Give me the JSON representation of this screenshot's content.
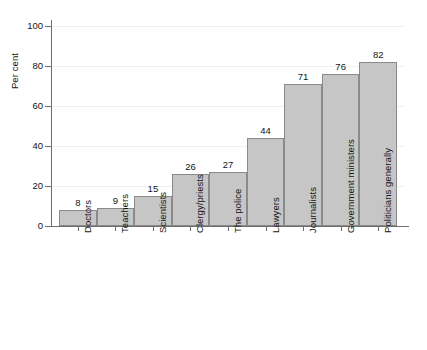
{
  "chart_data": {
    "type": "bar",
    "title": "",
    "subtitle": "",
    "xlabel": "",
    "ylabel": "Per cent",
    "ylim": [
      0,
      100
    ],
    "yticks": [
      0,
      20,
      40,
      60,
      80,
      100
    ],
    "grid": true,
    "legend": false,
    "orientation": "vertical",
    "bar_color": "#c6c6c6",
    "bar_border_color": "#8a8a8a",
    "axis_color": "#6e6e6e",
    "gridline_color": "#f0f0f0",
    "text_color": "#141414",
    "categories": [
      "Doctors",
      "Teachers",
      "Scientists",
      "Clergy/priests",
      "The police",
      "Lawyers",
      "Journalists",
      "Government ministers",
      "Politicians generally"
    ],
    "values": [
      8,
      9,
      15,
      26,
      27,
      44,
      71,
      76,
      82
    ],
    "value_labels": [
      "8",
      "9",
      "15",
      "26",
      "27",
      "44",
      "71",
      "76",
      "82"
    ],
    "ytick_labels": [
      "0",
      "20",
      "40",
      "60",
      "80",
      "100"
    ]
  }
}
